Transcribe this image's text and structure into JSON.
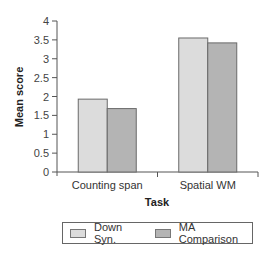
{
  "chart_data": {
    "type": "bar",
    "title": "",
    "xlabel": "Task",
    "ylabel": "Mean score",
    "ylim": [
      0,
      4
    ],
    "yticks": [
      0,
      0.5,
      1,
      1.5,
      2,
      2.5,
      3,
      3.5,
      4
    ],
    "ytick_labels": [
      "0",
      "0.5",
      "1",
      "1.5",
      "2",
      "2.5",
      "3",
      "3.5",
      "4"
    ],
    "grid": false,
    "legend_position": "bottom",
    "categories": [
      "Counting span",
      "Spatial WM"
    ],
    "series": [
      {
        "name": "Down Syn.",
        "values": [
          1.93,
          3.55
        ],
        "color": "#dcdcdc"
      },
      {
        "name": "MA Comparison",
        "values": [
          1.68,
          3.42
        ],
        "color": "#b4b4b4"
      }
    ]
  },
  "legend": {
    "items": [
      {
        "label": "Down Syn.",
        "color": "#dcdcdc"
      },
      {
        "label": "MA Comparison",
        "color": "#b4b4b4"
      }
    ]
  }
}
